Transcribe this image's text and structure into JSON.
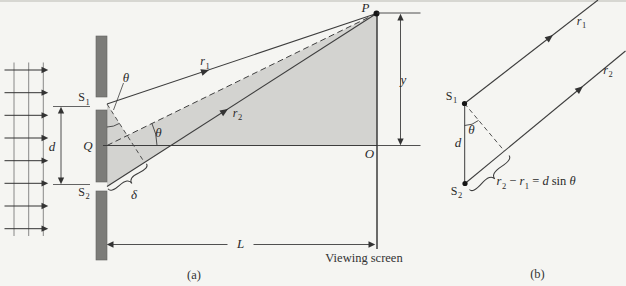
{
  "colors": {
    "background": "#f5f5f2",
    "shade": "#d3d3d0",
    "barrier": "#7c7c79",
    "line": "#3d3d3d",
    "text": "#2a2a2a"
  },
  "panel_a": {
    "caption": "(a)",
    "slit1": {
      "base": "S",
      "sub": "1"
    },
    "slit2": {
      "base": "S",
      "sub": "2"
    },
    "midpoint": "Q",
    "slit_separation": "d",
    "theta_at_slits": "θ",
    "theta_at_axis": "θ",
    "ray1": {
      "base": "r",
      "sub": "1"
    },
    "ray2": {
      "base": "r",
      "sub": "2"
    },
    "path_difference": "δ",
    "point_p": "P",
    "point_o": "O",
    "screen_height": "y",
    "screen_distance": "L",
    "screen_label": "Viewing screen"
  },
  "panel_b": {
    "caption": "(b)",
    "slit1": {
      "base": "S",
      "sub": "1"
    },
    "slit2": {
      "base": "S",
      "sub": "2"
    },
    "slit_separation": "d",
    "theta": "θ",
    "ray1": {
      "base": "r",
      "sub": "1"
    },
    "ray2": {
      "base": "r",
      "sub": "2"
    },
    "equation": {
      "r2": "r",
      "r2_sub": "2",
      "minus": " − ",
      "r1": "r",
      "r1_sub": "1",
      "equals": " = ",
      "d": "d",
      "sin": " sin ",
      "theta": "θ"
    }
  }
}
